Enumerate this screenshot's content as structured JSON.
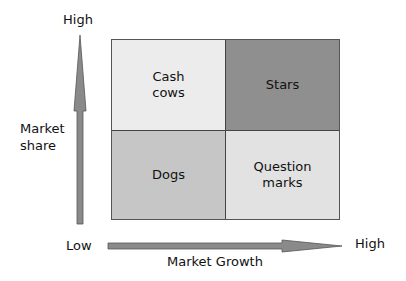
{
  "diagram": {
    "type": "2x2 matrix (BCG growth-share matrix)",
    "y_axis": {
      "title": "Market\nshare",
      "high_label": "High"
    },
    "x_axis": {
      "title": "Market Growth",
      "low_label": "Low",
      "high_label": "High"
    },
    "quadrants": [
      {
        "position": "top-left",
        "label": "Cash\ncows",
        "color": "#ececec"
      },
      {
        "position": "top-right",
        "label": "Stars",
        "color": "#8f8f8f"
      },
      {
        "position": "bottom-left",
        "label": "Dogs",
        "color": "#c6c6c6"
      },
      {
        "position": "bottom-right",
        "label": "Question\nmarks",
        "color": "#e2e2e2"
      }
    ],
    "arrow_color": "#8a8a8a"
  }
}
